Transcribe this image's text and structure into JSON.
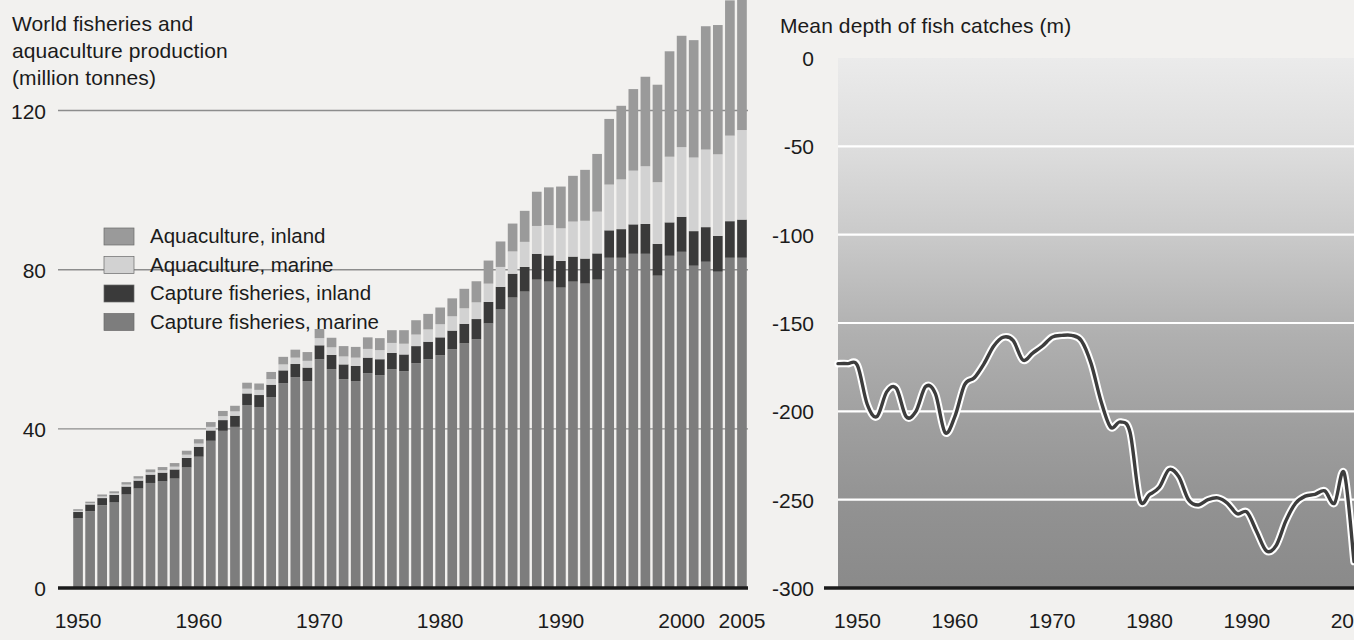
{
  "left_panel": {
    "title": "World fisheries and\naquaculture production\n(million tonnes)",
    "y_ticks": [
      "120",
      "80",
      "40",
      "0"
    ],
    "x_ticks": [
      "1950",
      "1960",
      "1970",
      "1980",
      "1990",
      "2000",
      "2005"
    ],
    "legend": [
      {
        "label": "Aquaculture, inland",
        "color": "#9a9a9a"
      },
      {
        "label": "Aquaculture, marine",
        "color": "#d2d2d2"
      },
      {
        "label": "Capture fisheries, inland",
        "color": "#3a3a3a"
      },
      {
        "label": "Capture fisheries, marine",
        "color": "#7d7d7d"
      }
    ]
  },
  "right_panel": {
    "title": "Mean depth of fish catches (m)",
    "y_ticks": [
      "0",
      "-50",
      "-100",
      "-150",
      "-200",
      "-250",
      "-300"
    ],
    "x_ticks": [
      "1950",
      "1960",
      "1970",
      "1980",
      "1990",
      "2001"
    ],
    "line_color": "#3d3d3d",
    "gridline_color": "#ffffff",
    "band_top_color": "#e6e6e6",
    "band_bottom_color": "#8f8f8f"
  },
  "chart_data": [
    {
      "type": "bar",
      "id": "world-fisheries-aquaculture-production",
      "title": "World fisheries and aquaculture production (million tonnes)",
      "xlabel": "",
      "ylabel": "million tonnes",
      "ylim": [
        0,
        140
      ],
      "xlim": [
        1950,
        2005
      ],
      "grid": true,
      "stacked": true,
      "legend_position": "inside-upper-left",
      "categories": [
        1950,
        1951,
        1952,
        1953,
        1954,
        1955,
        1956,
        1957,
        1958,
        1959,
        1960,
        1961,
        1962,
        1963,
        1964,
        1965,
        1966,
        1967,
        1968,
        1969,
        1970,
        1971,
        1972,
        1973,
        1974,
        1975,
        1976,
        1977,
        1978,
        1979,
        1980,
        1981,
        1982,
        1983,
        1984,
        1985,
        1986,
        1987,
        1988,
        1989,
        1990,
        1991,
        1992,
        1993,
        1994,
        1995,
        1996,
        1997,
        1998,
        1999,
        2000,
        2001,
        2002,
        2003,
        2004,
        2005
      ],
      "series": [
        {
          "name": "Capture fisheries, marine",
          "color": "#7d7d7d",
          "values": [
            17.5,
            19.3,
            20.8,
            21.5,
            23.5,
            25.0,
            26.4,
            26.8,
            27.5,
            30.3,
            33.0,
            37.0,
            39.5,
            40.5,
            46.0,
            45.5,
            48.0,
            51.5,
            53.0,
            52.0,
            57.5,
            55.0,
            52.5,
            52.0,
            54.0,
            53.5,
            55.0,
            54.5,
            56.5,
            57.5,
            58.5,
            60.0,
            61.5,
            62.5,
            66.5,
            70.0,
            73.0,
            74.5,
            77.5,
            77.0,
            75.5,
            77.0,
            76.5,
            77.5,
            83.0,
            83.0,
            84.0,
            84.0,
            78.5,
            83.5,
            84.5,
            81.0,
            82.0,
            79.5,
            83.0,
            83.0
          ]
        },
        {
          "name": "Capture fisheries, inland",
          "color": "#3a3a3a",
          "values": [
            1.6,
            1.7,
            1.8,
            1.9,
            2.0,
            2.0,
            2.1,
            2.2,
            2.3,
            2.4,
            2.5,
            2.6,
            2.7,
            2.8,
            2.9,
            3.0,
            3.1,
            3.2,
            3.3,
            3.4,
            3.5,
            3.6,
            3.7,
            3.8,
            3.9,
            4.0,
            4.1,
            4.2,
            4.3,
            4.4,
            4.5,
            4.7,
            4.9,
            5.1,
            5.4,
            5.7,
            6.0,
            6.2,
            6.5,
            6.6,
            6.7,
            6.3,
            6.3,
            6.6,
            6.9,
            7.2,
            7.4,
            7.5,
            8.0,
            8.4,
            8.8,
            8.7,
            8.7,
            9.0,
            9.2,
            9.6
          ]
        },
        {
          "name": "Aquaculture, marine",
          "color": "#d2d2d2",
          "values": [
            0.3,
            0.3,
            0.4,
            0.4,
            0.5,
            0.5,
            0.6,
            0.6,
            0.7,
            0.8,
            0.8,
            0.9,
            1.0,
            1.1,
            1.2,
            1.3,
            1.4,
            1.5,
            1.6,
            1.7,
            1.8,
            1.9,
            2.0,
            2.1,
            2.2,
            2.3,
            2.5,
            2.7,
            2.9,
            3.1,
            3.3,
            3.6,
            3.9,
            4.2,
            4.6,
            5.0,
            5.6,
            6.3,
            7.0,
            7.6,
            8.2,
            8.8,
            9.5,
            10.5,
            11.5,
            12.5,
            13.5,
            14.5,
            15.5,
            16.5,
            17.5,
            18.5,
            19.5,
            20.5,
            21.5,
            22.5
          ]
        },
        {
          "name": "Aquaculture, inland",
          "color": "#9a9a9a",
          "values": [
            0.4,
            0.4,
            0.5,
            0.5,
            0.6,
            0.6,
            0.7,
            0.8,
            0.9,
            1.0,
            1.1,
            1.2,
            1.3,
            1.4,
            1.5,
            1.6,
            1.8,
            1.9,
            2.0,
            2.2,
            2.3,
            2.4,
            2.6,
            2.7,
            2.9,
            3.0,
            3.2,
            3.4,
            3.6,
            3.9,
            4.2,
            4.5,
            4.9,
            5.3,
            5.8,
            6.4,
            7.0,
            7.8,
            8.6,
            9.5,
            10.5,
            11.5,
            12.8,
            14.5,
            16.5,
            18.5,
            20.5,
            22.5,
            24.5,
            26.5,
            28.0,
            29.5,
            31.0,
            32.5,
            34.0,
            35.5
          ]
        }
      ]
    },
    {
      "type": "line",
      "id": "mean-depth-of-fish-catches",
      "title": "Mean depth of fish catches (m)",
      "xlabel": "",
      "ylabel": "Mean depth of fish catches (m)",
      "ylim": [
        -300,
        0
      ],
      "xlim": [
        1948,
        2001
      ],
      "grid": true,
      "line_color": "#3d3d3d",
      "x": [
        1948,
        1949,
        1950,
        1951,
        1952,
        1953,
        1954,
        1955,
        1956,
        1957,
        1958,
        1959,
        1960,
        1961,
        1962,
        1963,
        1964,
        1965,
        1966,
        1967,
        1968,
        1969,
        1970,
        1971,
        1972,
        1973,
        1974,
        1975,
        1976,
        1977,
        1978,
        1979,
        1980,
        1981,
        1982,
        1983,
        1984,
        1985,
        1986,
        1987,
        1988,
        1989,
        1990,
        1991,
        1992,
        1993,
        1994,
        1995,
        1996,
        1997,
        1998,
        1999,
        2000,
        2001
      ],
      "y": [
        -173,
        -173,
        -174,
        -196,
        -203,
        -189,
        -187,
        -203,
        -200,
        -186,
        -190,
        -212,
        -203,
        -185,
        -181,
        -173,
        -163,
        -158,
        -160,
        -171,
        -167,
        -163,
        -158,
        -157,
        -157,
        -160,
        -173,
        -194,
        -209,
        -206,
        -212,
        -250,
        -247,
        -243,
        -233,
        -237,
        -250,
        -253,
        -250,
        -249,
        -252,
        -258,
        -257,
        -268,
        -279,
        -276,
        -262,
        -252,
        -248,
        -247,
        -245,
        -252,
        -235,
        -285
      ]
    }
  ]
}
